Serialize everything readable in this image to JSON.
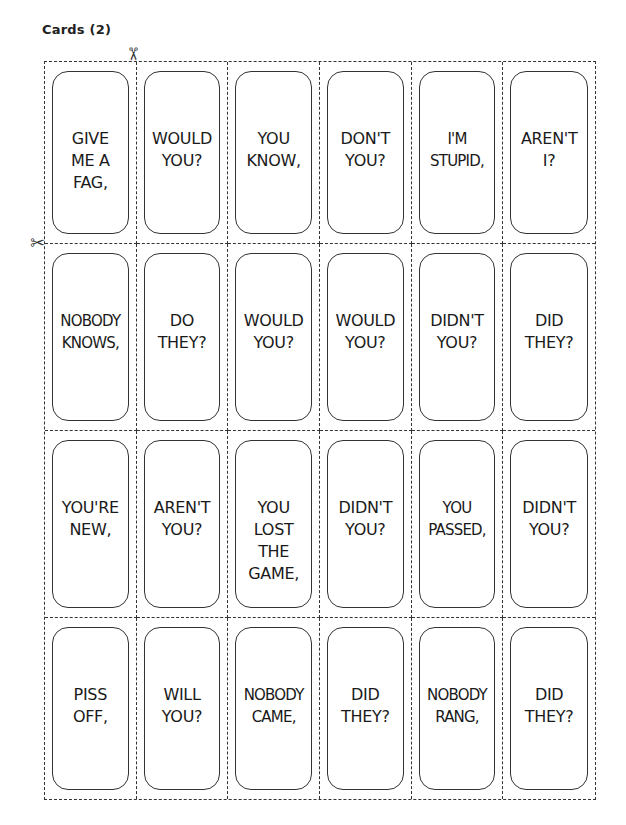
{
  "title": "Cards (2)",
  "icons": {
    "scissors_top": "✂",
    "scissors_left": "✂"
  },
  "cards": [
    [
      "GIVE\nME A\nFAG,",
      "WOULD\nYOU?",
      "YOU\nKNOW,",
      "DON'T\nYOU?",
      "I'M\nSTUPID,",
      "AREN'T\nI?"
    ],
    [
      "NOBODY\nKNOWS,",
      "DO\nTHEY?",
      "WOULD\nYOU?",
      "WOULD\nYOU?",
      "DIDN'T\nYOU?",
      "DID\nTHEY?"
    ],
    [
      "YOU'RE\nNEW,",
      "AREN'T\nYOU?",
      "YOU\nLOST\nTHE\nGAME,",
      "DIDN'T\nYOU?",
      "YOU\nPASSED,",
      "DIDN'T\nYOU?"
    ],
    [
      "PISS\nOFF,",
      "WILL\nYOU?",
      "NOBODY\nCAME,",
      "DID\nTHEY?",
      "NOBODY\nRANG,",
      "DID\nTHEY?"
    ]
  ]
}
